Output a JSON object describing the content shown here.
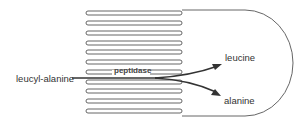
{
  "diagram": {
    "type": "intestinal-cell-with-microvilli",
    "labels": {
      "substrate": "leucyl-alanine",
      "enzyme": "peptidase",
      "product_1": "leucine",
      "product_2": "alanine"
    },
    "villi_count": 11,
    "colors": {
      "outline": "#555555",
      "arrow": "#333333",
      "text": "#333333"
    }
  }
}
